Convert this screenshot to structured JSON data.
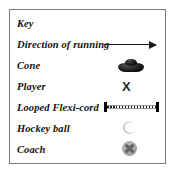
{
  "panel": {
    "title": "Key",
    "border_color": "#7a7a7a",
    "background_color": "#ffffff"
  },
  "rows": [
    {
      "label": "Key",
      "symbol": "none"
    },
    {
      "label": "Direction of running",
      "symbol": "arrow-right-icon"
    },
    {
      "label": "Cone",
      "symbol": "cone-icon"
    },
    {
      "label": "Player",
      "symbol": "player-x-icon",
      "glyph": "X"
    },
    {
      "label": "Looped Flexi-cord",
      "symbol": "flexi-cord-icon"
    },
    {
      "label": "Hockey ball",
      "symbol": "hockey-ball-icon"
    },
    {
      "label": "Coach",
      "symbol": "coach-icon"
    }
  ]
}
